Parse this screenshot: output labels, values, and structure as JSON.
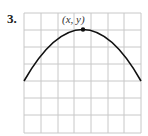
{
  "problem": {
    "number": "3."
  },
  "graph": {
    "grid": {
      "cols": 7,
      "rows": 7
    },
    "point_label": "(x, y)",
    "curve": "downward parabola with vertex at top",
    "colors": {
      "grid": "#c8c8c8",
      "curve": "#111111"
    }
  }
}
